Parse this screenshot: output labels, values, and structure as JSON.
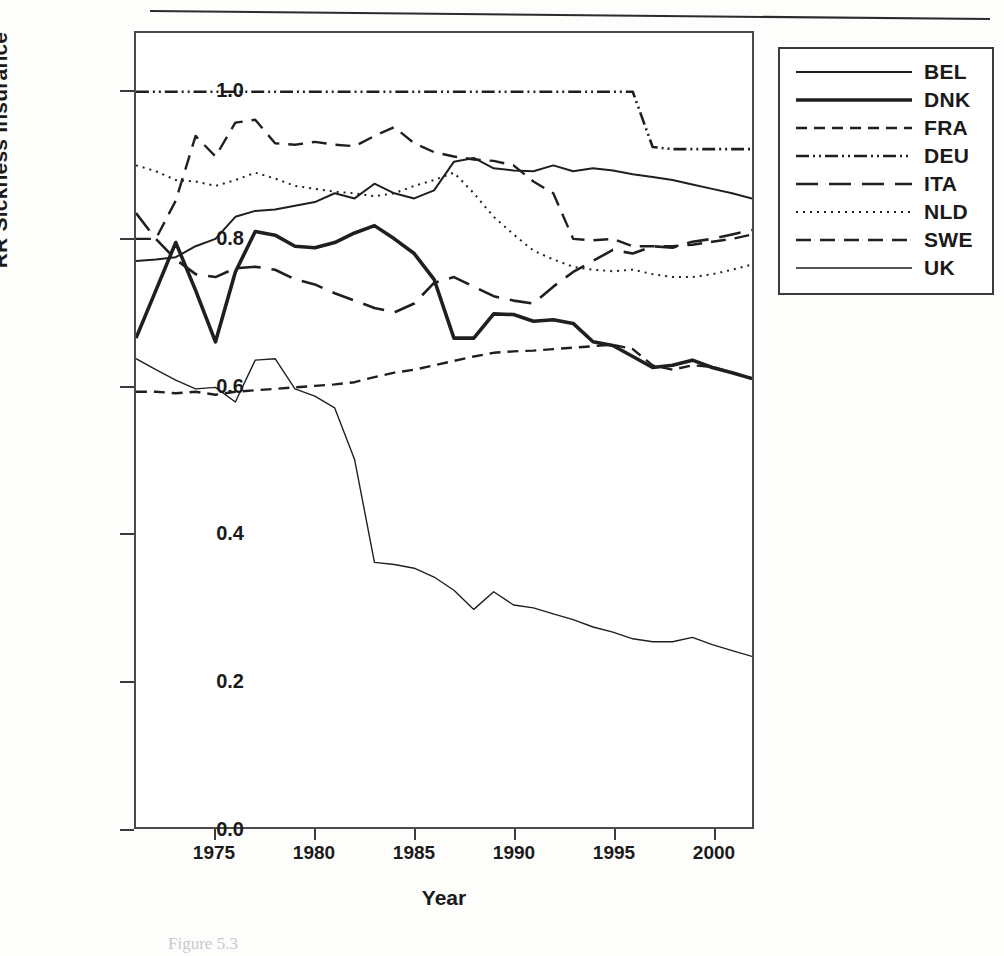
{
  "figure": {
    "caption_fragment": "Figure 5.3",
    "top_rule": "horizontal-rule"
  },
  "axes": {
    "y_label": "RR Sickness Insurance",
    "x_label": "Year",
    "y_ticks": [
      "0.0",
      "0.2",
      "0.4",
      "0.6",
      "0.8",
      "1.0"
    ],
    "y_tick_values": [
      0.0,
      0.2,
      0.4,
      0.6,
      0.8,
      1.0
    ],
    "x_ticks": [
      "1975",
      "1980",
      "1985",
      "1990",
      "1995",
      "2000"
    ],
    "x_tick_values": [
      1975,
      1980,
      1985,
      1990,
      1995,
      2000
    ]
  },
  "legend": {
    "position": "right",
    "items": [
      {
        "label": "BEL",
        "style": "solid-thin",
        "dash": "none",
        "width": 2.0
      },
      {
        "label": "DNK",
        "style": "solid-thick",
        "dash": "none",
        "width": 3.6
      },
      {
        "label": "FRA",
        "style": "dashed-short",
        "dash": "11,7",
        "width": 2.4
      },
      {
        "label": "DEU",
        "style": "dash-dot-dot",
        "dash": "13,4,2,4,2,4",
        "width": 2.6
      },
      {
        "label": "ITA",
        "style": "dashed-long",
        "dash": "22,11",
        "width": 2.6
      },
      {
        "label": "NLD",
        "style": "dotted",
        "dash": "2,5",
        "width": 2.0
      },
      {
        "label": "SWE",
        "style": "dashed-medium",
        "dash": "15,9",
        "width": 2.4
      },
      {
        "label": "UK",
        "style": "solid-hairline",
        "dash": "none",
        "width": 1.4
      }
    ]
  },
  "chart_data": {
    "type": "line",
    "title": "",
    "xlabel": "Year",
    "ylabel": "RR Sickness Insurance",
    "xlim": [
      1971,
      2002
    ],
    "ylim": [
      0.0,
      1.08
    ],
    "grid": false,
    "legend_position": "right-outside",
    "x": [
      1971,
      1972,
      1973,
      1974,
      1975,
      1976,
      1977,
      1978,
      1979,
      1980,
      1981,
      1982,
      1983,
      1984,
      1985,
      1986,
      1987,
      1988,
      1989,
      1990,
      1991,
      1992,
      1993,
      1994,
      1995,
      1996,
      1997,
      1998,
      1999,
      2000,
      2001,
      2002
    ],
    "series": [
      {
        "name": "BEL",
        "style": "solid-thin",
        "values": [
          0.77,
          0.772,
          0.775,
          0.79,
          0.8,
          0.83,
          0.838,
          0.84,
          0.845,
          0.85,
          0.862,
          0.855,
          0.875,
          0.862,
          0.855,
          0.866,
          0.905,
          0.91,
          0.896,
          0.893,
          0.892,
          0.9,
          0.892,
          0.896,
          0.893,
          0.888,
          0.884,
          0.88,
          0.874,
          0.868,
          0.862,
          0.855
        ]
      },
      {
        "name": "DNK",
        "style": "solid-thick",
        "values": [
          0.665,
          0.73,
          0.795,
          0.73,
          0.66,
          0.755,
          0.81,
          0.805,
          0.79,
          0.788,
          0.795,
          0.808,
          0.818,
          0.8,
          0.78,
          0.745,
          0.665,
          0.665,
          0.698,
          0.697,
          0.688,
          0.69,
          0.685,
          0.66,
          0.655,
          0.64,
          0.625,
          0.628,
          0.635,
          0.625,
          0.618,
          0.61
        ]
      },
      {
        "name": "FRA",
        "style": "dashed-short",
        "values": [
          0.592,
          0.592,
          0.59,
          0.592,
          0.588,
          0.592,
          0.594,
          0.596,
          0.598,
          0.6,
          0.602,
          0.605,
          0.612,
          0.618,
          0.622,
          0.628,
          0.634,
          0.64,
          0.645,
          0.647,
          0.648,
          0.65,
          0.652,
          0.654,
          0.656,
          0.65,
          0.628,
          0.622,
          0.628,
          0.626,
          0.618,
          0.61
        ]
      },
      {
        "name": "DEU",
        "style": "dash-dot-dot",
        "values": [
          1.0,
          1.0,
          1.0,
          1.0,
          1.0,
          1.0,
          1.0,
          1.0,
          1.0,
          1.0,
          1.0,
          1.0,
          1.0,
          1.0,
          1.0,
          1.0,
          1.0,
          1.0,
          1.0,
          1.0,
          1.0,
          1.0,
          1.0,
          1.0,
          1.0,
          1.0,
          0.925,
          0.922,
          0.922,
          0.922,
          0.922,
          0.922
        ]
      },
      {
        "name": "ITA",
        "style": "dashed-long",
        "values": [
          0.835,
          0.8,
          0.772,
          0.752,
          0.748,
          0.76,
          0.762,
          0.758,
          0.745,
          0.738,
          0.726,
          0.716,
          0.706,
          0.7,
          0.712,
          0.74,
          0.748,
          0.735,
          0.722,
          0.716,
          0.712,
          0.735,
          0.755,
          0.77,
          0.785,
          0.78,
          0.79,
          0.788,
          0.796,
          0.8,
          0.806,
          0.812
        ]
      },
      {
        "name": "NLD",
        "style": "dotted",
        "values": [
          0.9,
          0.892,
          0.88,
          0.878,
          0.872,
          0.88,
          0.89,
          0.882,
          0.872,
          0.868,
          0.864,
          0.862,
          0.858,
          0.862,
          0.872,
          0.88,
          0.89,
          0.862,
          0.83,
          0.806,
          0.784,
          0.772,
          0.762,
          0.758,
          0.756,
          0.758,
          0.752,
          0.748,
          0.748,
          0.752,
          0.758,
          0.765
        ]
      },
      {
        "name": "SWE",
        "style": "dashed-medium",
        "values": [
          0.8,
          0.8,
          0.852,
          0.94,
          0.912,
          0.958,
          0.962,
          0.93,
          0.928,
          0.932,
          0.928,
          0.926,
          0.94,
          0.952,
          0.93,
          0.918,
          0.912,
          0.908,
          0.906,
          0.9,
          0.878,
          0.862,
          0.8,
          0.798,
          0.8,
          0.79,
          0.79,
          0.79,
          0.792,
          0.796,
          0.8,
          0.806
        ]
      },
      {
        "name": "UK",
        "style": "solid-hairline",
        "values": [
          0.637,
          0.622,
          0.608,
          0.596,
          0.598,
          0.578,
          0.635,
          0.637,
          0.596,
          0.586,
          0.57,
          0.5,
          0.36,
          0.357,
          0.352,
          0.34,
          0.322,
          0.296,
          0.32,
          0.302,
          0.298,
          0.29,
          0.282,
          0.272,
          0.265,
          0.256,
          0.252,
          0.252,
          0.258,
          0.248,
          0.24,
          0.232
        ]
      }
    ]
  }
}
